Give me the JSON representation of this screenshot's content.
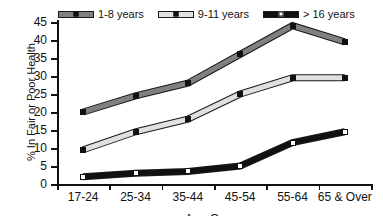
{
  "chart_data": {
    "type": "line",
    "title": "",
    "xlabel": "Age Group",
    "ylabel": "% In Fair or Poor Health",
    "categories": [
      "17-24",
      "25-34",
      "35-44",
      "45-54",
      "55-64",
      "65 & Over"
    ],
    "ylim": [
      0,
      45
    ],
    "yticks": [
      0,
      5,
      10,
      15,
      20,
      25,
      30,
      35,
      40,
      45
    ],
    "grid": false,
    "legend_position": "top",
    "series": [
      {
        "name": "1-8 years",
        "values": [
          20,
          24.5,
          28,
          36,
          44,
          39.5
        ],
        "line_color": "#808080",
        "marker_color": "#111111"
      },
      {
        "name": "9-11 years",
        "values": [
          9.5,
          14.5,
          18,
          25,
          29.5,
          29.5
        ],
        "line_color": "#e0e0e0",
        "marker_color": "#111111"
      },
      {
        "name": "> 16 years",
        "values": [
          2,
          3,
          3.5,
          5,
          11.5,
          14.5
        ],
        "line_color": "#111111",
        "marker_color": "#ffffff"
      }
    ]
  }
}
